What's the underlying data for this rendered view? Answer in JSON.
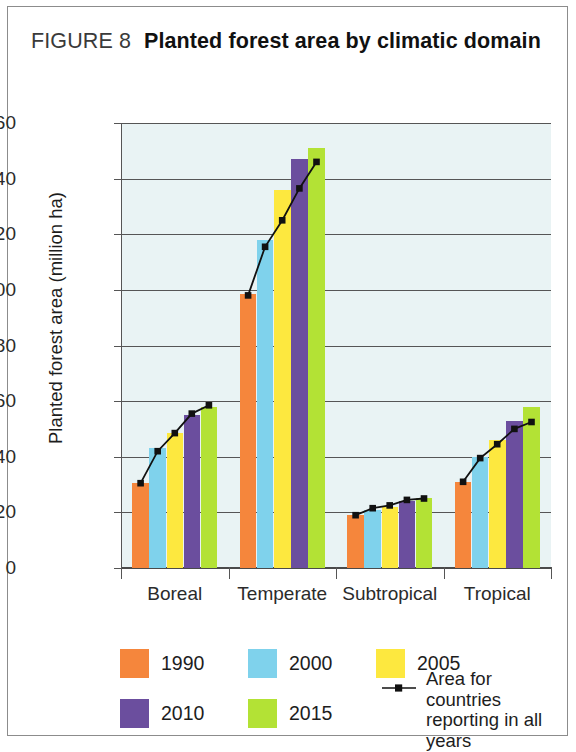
{
  "figure": {
    "label": "FIGURE 8",
    "caption": "Planted forest area by climatic domain"
  },
  "chart_data": {
    "type": "bar",
    "title": "Planted forest area by climatic domain",
    "xlabel": "",
    "ylabel": "Planted forest area (million ha)",
    "ylim": [
      0,
      160
    ],
    "ytick_step": 20,
    "yticks": [
      0,
      20,
      40,
      60,
      80,
      100,
      120,
      140,
      160
    ],
    "grid": true,
    "legend_position": "bottom",
    "categories": [
      "Boreal",
      "Temperate",
      "Subtropical",
      "Tropical"
    ],
    "series": [
      {
        "name": "1990",
        "color": "#F5863C",
        "values": [
          30.5,
          98.5,
          19.0,
          31.0
        ]
      },
      {
        "name": "2000",
        "color": "#7FD2EC",
        "values": [
          43.0,
          118.0,
          21.0,
          40.0
        ]
      },
      {
        "name": "2005",
        "color": "#FDE83F",
        "values": [
          48.5,
          136.0,
          22.0,
          46.0
        ]
      },
      {
        "name": "2010",
        "color": "#6B4E9E",
        "values": [
          55.0,
          147.0,
          24.0,
          53.0
        ]
      },
      {
        "name": "2015",
        "color": "#B3E235",
        "values": [
          58.0,
          151.0,
          25.0,
          58.0
        ]
      }
    ],
    "overlay_line": {
      "name": "Area for countries reporting in all years",
      "color": "#111111",
      "marker": "square",
      "values": [
        [
          30.5,
          42.0,
          48.5,
          55.5,
          58.5
        ],
        [
          98.0,
          115.5,
          125.0,
          136.5,
          146.0
        ],
        [
          19.0,
          21.5,
          22.5,
          24.5,
          25.0
        ],
        [
          31.0,
          39.5,
          44.5,
          50.0,
          52.5
        ]
      ]
    }
  },
  "legend": {
    "entries": [
      {
        "label": "1990",
        "color": "#F5863C"
      },
      {
        "label": "2000",
        "color": "#7FD2EC"
      },
      {
        "label": "2005",
        "color": "#FDE83F"
      },
      {
        "label": "2010",
        "color": "#6B4E9E"
      },
      {
        "label": "2015",
        "color": "#B3E235"
      }
    ],
    "series_line_label": "Area for countries\nreporting in all years"
  }
}
